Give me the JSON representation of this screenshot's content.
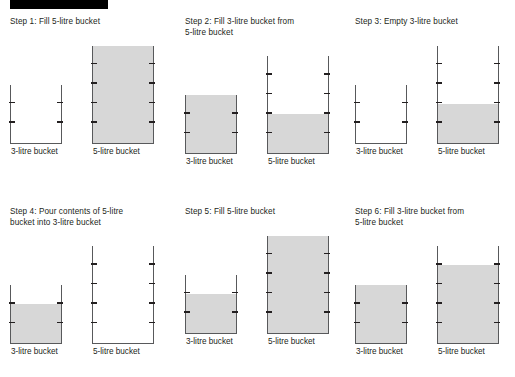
{
  "page": {
    "background_color": "#ffffff",
    "redaction_bar": {
      "label": "redacted-title-bar",
      "color": "#000000"
    }
  },
  "style": {
    "bucket_outline_color": "#58595b",
    "tick_color": "#231f20",
    "liquid_color": "#d7d7d7",
    "text_color": "#231f20"
  },
  "buckets": {
    "small": {
      "capacity": 3,
      "label": "3-litre bucket",
      "tick_count": 2
    },
    "large": {
      "capacity": 5,
      "label": "5-litre bucket",
      "tick_count": 4
    }
  },
  "steps": [
    {
      "index": 1,
      "title": "Step 1: Fill 5-litre bucket",
      "small_label": "3-litre bucket",
      "large_label": "5-litre bucket",
      "small_fill": 0,
      "large_fill": 5,
      "small_fill_text": "0 of 3 litres",
      "large_fill_text": "5 of 5 litres"
    },
    {
      "index": 2,
      "title": "Step 2: Fill 3-litre bucket from\n5-litre bucket",
      "small_label": "3-litre bucket",
      "large_label": "5-litre bucket",
      "small_fill": 3,
      "large_fill": 2,
      "small_fill_text": "3 of 3 litres",
      "large_fill_text": "2 of 5 litres"
    },
    {
      "index": 3,
      "title": "Step 3: Empty 3-litre bucket",
      "small_label": "3-litre bucket",
      "large_label": "5-litre bucket",
      "small_fill": 0,
      "large_fill": 2,
      "small_fill_text": "0 of 3 litres",
      "large_fill_text": "2 of 5 litres"
    },
    {
      "index": 4,
      "title": "Step 4: Pour contents of 5-litre\nbucket into 3-litre bucket",
      "small_label": "3-litre bucket",
      "large_label": "5-litre bucket",
      "small_fill": 2,
      "large_fill": 0,
      "small_fill_text": "2 of 3 litres",
      "large_fill_text": "0 of 5 litres"
    },
    {
      "index": 5,
      "title": "Step 5: Fill 5-litre bucket",
      "small_label": "3-litre bucket",
      "large_label": "5-litre bucket",
      "small_fill": 2,
      "large_fill": 5,
      "small_fill_text": "2 of 3 litres",
      "large_fill_text": "5 of 5 litres"
    },
    {
      "index": 6,
      "title": "Step 6: Fill 3-litre bucket from\n5-litre bucket",
      "small_label": "3-litre bucket",
      "large_label": "5-litre bucket",
      "small_fill": 3,
      "large_fill": 4,
      "small_fill_text": "3 of 3 litres",
      "large_fill_text": "4 of 5 litres"
    }
  ]
}
